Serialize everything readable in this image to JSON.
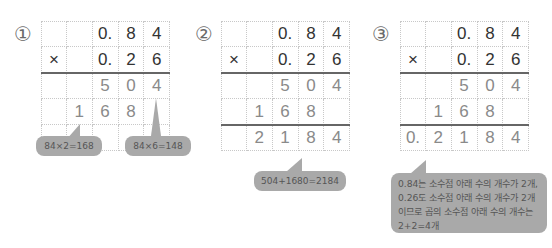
{
  "steps": [
    {
      "number": "①",
      "rows": [
        [
          "",
          "",
          "0.",
          "8",
          "4"
        ],
        [
          "×",
          "",
          "0.",
          "2",
          "6"
        ],
        [
          "",
          "",
          "5",
          "0",
          "4"
        ],
        [
          "",
          "1",
          "6",
          "8",
          ""
        ],
        [
          "",
          "",
          "",
          "",
          ""
        ]
      ],
      "callouts": [
        {
          "text": "84×2=168"
        },
        {
          "text": "84×6=148"
        }
      ]
    },
    {
      "number": "②",
      "rows": [
        [
          "",
          "",
          "0.",
          "8",
          "4"
        ],
        [
          "×",
          "",
          "0.",
          "2",
          "6"
        ],
        [
          "",
          "",
          "5",
          "0",
          "4"
        ],
        [
          "",
          "1",
          "6",
          "8",
          ""
        ],
        [
          "",
          "2",
          "1",
          "8",
          "4"
        ]
      ],
      "callouts": [
        {
          "text": "504+1680=2184"
        }
      ]
    },
    {
      "number": "③",
      "rows": [
        [
          "",
          "",
          "0.",
          "8",
          "4"
        ],
        [
          "×",
          "",
          "0.",
          "2",
          "6"
        ],
        [
          "",
          "",
          "5",
          "0",
          "4"
        ],
        [
          "",
          "1",
          "6",
          "8",
          ""
        ],
        [
          "0.",
          "2",
          "1",
          "8",
          "4"
        ]
      ],
      "callouts": [
        {
          "lines": [
            "0.84는 소수점 아래 수의 개수가 2개,",
            "0.26도 소수점 아래 수의 개수가 2개",
            "이므로 곱의 소수점 아래 수의 개수는",
            "2+2=4개"
          ]
        }
      ]
    }
  ],
  "colors": {
    "operand_digit": "#333333",
    "result_digit": "#8a8a8a",
    "callout_bg": "#a9a9a9",
    "callout_text": "#555555",
    "rule": "#666666"
  }
}
